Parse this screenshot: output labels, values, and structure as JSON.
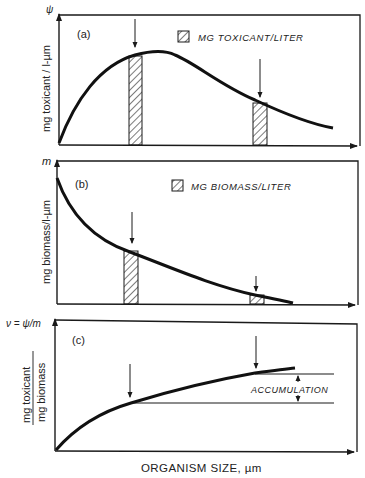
{
  "panels": {
    "a": {
      "tag": "(a)",
      "axis_symbol": "ψ",
      "ylabel": "mg toxicant / l-µm",
      "legend": "MG TOXICANT/LITER"
    },
    "b": {
      "tag": "(b)",
      "axis_symbol": "m",
      "ylabel": "mg biomass/l-µm",
      "legend": "MG BIOMASS/LITER"
    },
    "c": {
      "tag": "(c)",
      "axis_symbol": "ν = ψ/m",
      "ylabel_numerator": "mg toxicant",
      "ylabel_denominator": "mg biomass",
      "annotation": "ACCUMULATION"
    }
  },
  "xlabel": "ORGANISM SIZE, µm",
  "colors": {
    "ink": "#1a1a1a",
    "background": "#ffffff"
  }
}
